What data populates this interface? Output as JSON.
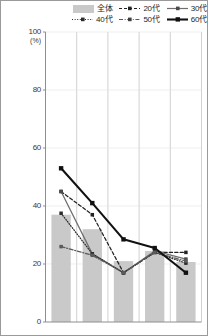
{
  "chart_data": {
    "type": "bar",
    "title": "",
    "subtitle": "",
    "xlabel": "",
    "ylabel": "(%)",
    "ylim": [
      0,
      100
    ],
    "yticks": [
      0,
      20,
      40,
      60,
      80,
      100
    ],
    "grid": true,
    "legend_position": "top-right",
    "categories": [
      "1",
      "2",
      "3",
      "4",
      "5"
    ],
    "series": [
      {
        "name": "全体",
        "type": "bar",
        "style": "fill",
        "color": "#c9c9c9",
        "values": [
          37.0,
          32.0,
          21.0,
          24.5,
          20.7
        ]
      },
      {
        "name": "20代",
        "type": "line",
        "style": "dashed",
        "color": "#222222",
        "values": [
          45.0,
          37.0,
          17.0,
          24.0,
          24.0
        ]
      },
      {
        "name": "30代",
        "type": "line",
        "style": "solid",
        "color": "#6f6f6f",
        "values": [
          45.0,
          23.5,
          17.0,
          24.5,
          21.7
        ]
      },
      {
        "name": "40代",
        "type": "line",
        "style": "dotted",
        "color": "#2b2b2b",
        "values": [
          37.5,
          23.5,
          17.0,
          24.0,
          20.3
        ]
      },
      {
        "name": "50代",
        "type": "line",
        "style": "dashdot",
        "color": "#5a5a5a",
        "values": [
          26.0,
          23.0,
          17.0,
          24.0,
          21.0
        ]
      },
      {
        "name": "60代",
        "type": "line",
        "style": "solid-bold",
        "color": "#111111",
        "values": [
          53.0,
          41.0,
          28.5,
          25.5,
          17.0
        ]
      }
    ]
  },
  "legend": {
    "row1": [
      {
        "label": "全体",
        "swatch": "bar-swatch"
      },
      {
        "label": "20代",
        "swatch": "dashed-line-swatch"
      },
      {
        "label": "30代",
        "swatch": "solid-line-swatch"
      }
    ],
    "row2": [
      {
        "label": "40代",
        "swatch": "dotted-line-swatch"
      },
      {
        "label": "50代",
        "swatch": "dashdot-line-swatch"
      },
      {
        "label": "60代",
        "swatch": "bold-line-swatch"
      }
    ]
  },
  "axis": {
    "unit": "(%)",
    "ticks": [
      "100",
      "80",
      "60",
      "40",
      "20",
      "0"
    ]
  }
}
